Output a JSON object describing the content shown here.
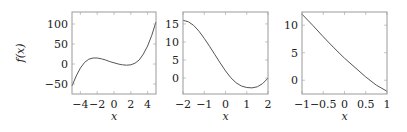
{
  "chart_data": [
    {
      "type": "line",
      "title": "",
      "xlabel": "x",
      "ylabel": "f(x)",
      "xlim": [
        -5,
        5
      ],
      "ylim": [
        -75,
        130
      ],
      "xticks": [
        -4,
        -2,
        0,
        2,
        4
      ],
      "xtick_labels": [
        "−4",
        "−2",
        "0",
        "2",
        "4"
      ],
      "yticks": [
        -50,
        0,
        50,
        100
      ],
      "ytick_labels": [
        "−50",
        "0",
        "50",
        "100"
      ],
      "grid": false,
      "series": [
        {
          "name": "f(x)",
          "x": [
            -5,
            -4.5,
            -4,
            -3.5,
            -3,
            -2.5,
            -2,
            -1.5,
            -1,
            -0.5,
            0,
            0.5,
            1,
            1.5,
            2,
            2.5,
            3,
            3.5,
            4,
            4.5,
            5
          ],
          "y": [
            -55,
            -30,
            -10,
            4,
            12,
            15,
            15,
            13,
            10,
            6,
            3,
            0,
            -2,
            -3,
            -2,
            2,
            10,
            25,
            45,
            72,
            105
          ]
        }
      ]
    },
    {
      "type": "line",
      "title": "",
      "xlabel": "x",
      "ylabel": "",
      "xlim": [
        -2,
        2
      ],
      "ylim": [
        -4.4,
        18.3
      ],
      "xticks": [
        -2,
        -1,
        0,
        1,
        2
      ],
      "xtick_labels": [
        "−2",
        "−1",
        "0",
        "1",
        "2"
      ],
      "yticks": [
        0,
        5,
        10,
        15
      ],
      "ytick_labels": [
        "0",
        "5",
        "10",
        "15"
      ],
      "grid": false,
      "series": [
        {
          "name": "f(x)",
          "x": [
            -2,
            -1.75,
            -1.5,
            -1.25,
            -1,
            -0.75,
            -0.5,
            -0.25,
            0,
            0.25,
            0.5,
            0.75,
            1,
            1.25,
            1.5,
            1.75,
            2
          ],
          "y": [
            16,
            15.6,
            14.6,
            13,
            11,
            8.8,
            6.5,
            4.2,
            2,
            0.1,
            -1.3,
            -2.2,
            -2.6,
            -2.7,
            -2.4,
            -1.5,
            0
          ]
        }
      ]
    },
    {
      "type": "line",
      "title": "",
      "xlabel": "x",
      "ylabel": "",
      "xlim": [
        -1,
        1
      ],
      "ylim": [
        -2.5,
        12.4
      ],
      "xticks": [
        -1,
        -0.5,
        0,
        0.5,
        1
      ],
      "xtick_labels": [
        "−1",
        "−0.5",
        "0",
        "0.5",
        "1"
      ],
      "yticks": [
        0,
        5,
        10
      ],
      "ytick_labels": [
        "0",
        "5",
        "10"
      ],
      "grid": false,
      "series": [
        {
          "name": "f(x)",
          "x": [
            -1,
            -0.75,
            -0.5,
            -0.25,
            0,
            0.25,
            0.5,
            0.75,
            1
          ],
          "y": [
            12,
            10,
            7.9,
            5.9,
            4,
            2.3,
            0.6,
            -0.9,
            -2
          ]
        }
      ]
    }
  ]
}
